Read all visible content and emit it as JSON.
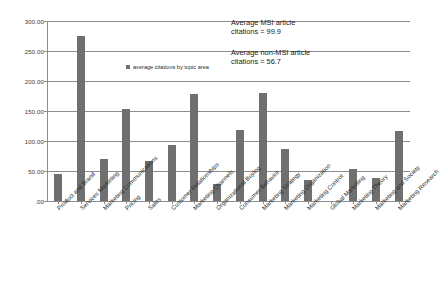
{
  "chart_data": {
    "type": "bar",
    "title": "",
    "xlabel": "",
    "ylabel": "",
    "ylim": [
      0,
      300
    ],
    "ytick_values": [
      0,
      50,
      100,
      150,
      200,
      250,
      300
    ],
    "ytick_labels": [
      ".00",
      "50.00",
      "100.00",
      "150.00",
      "200.00",
      "250.00",
      "300.00"
    ],
    "grid": true,
    "legend_position": "inside-upper-left",
    "legend": [
      "average citations by topic area"
    ],
    "categories": [
      "Product and Brand",
      "Services Marketing",
      "Marketing Communications",
      "Pricing",
      "Sales",
      "Customer Relationships",
      "Marketing Channels",
      "Organizational Buying",
      "Consumer Behavior",
      "Marketing Strategy",
      "Marketing Organization",
      "Marketing Control",
      "Global Marketing",
      "Marketing Theory",
      "Marketing and Society",
      "Marketing Research"
    ],
    "values": [
      45,
      275,
      70,
      153,
      67,
      93,
      178,
      28,
      118,
      180,
      86,
      35,
      0,
      54,
      38,
      116
    ],
    "series": [
      {
        "name": "average citations by topic area",
        "color": "#6f6f6f",
        "values": [
          45,
          275,
          70,
          153,
          67,
          93,
          178,
          28,
          118,
          180,
          86,
          35,
          0,
          54,
          38,
          116
        ]
      }
    ],
    "annotations": [
      {
        "line1": "Average MSI article",
        "line2": "citations = 99.9"
      },
      {
        "line1": "Average non-MSI article",
        "line2": "citations = 56.7"
      }
    ]
  },
  "colors": {
    "bar": "#6f6f6f",
    "grid": "#8d8d8d",
    "axis": "#8d8d8d",
    "text": "#2b2b2b",
    "background": "#ffffff"
  }
}
